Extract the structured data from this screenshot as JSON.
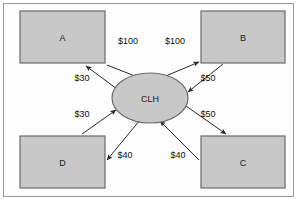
{
  "diagram": {
    "background_color": "#fdfdfd",
    "border_color": "#9a9a9a",
    "node_fill_color": "#c8c8c8",
    "node_stroke_color": "#6b6b6b",
    "edge_color": "#2b2b2b",
    "nodes": [
      {
        "id": "A",
        "label": "A",
        "shape": "rectangle",
        "x": 20,
        "y": 11,
        "w": 85,
        "h": 52
      },
      {
        "id": "B",
        "label": "B",
        "shape": "rectangle",
        "x": 201,
        "y": 11,
        "w": 84,
        "h": 52
      },
      {
        "id": "C",
        "label": "C",
        "shape": "rectangle",
        "x": 201,
        "y": 136,
        "w": 84,
        "h": 52
      },
      {
        "id": "D",
        "label": "D",
        "shape": "rectangle",
        "x": 20,
        "y": 136,
        "w": 85,
        "h": 52
      },
      {
        "id": "CLH",
        "label": "CLH",
        "shape": "ellipse",
        "cx": 150,
        "cy": 98,
        "rx": 38,
        "ry": 25
      }
    ],
    "edges": [
      {
        "from": "A",
        "to": "CLH",
        "label": "$100",
        "label_x": 128,
        "label_y": 44
      },
      {
        "from": "CLH",
        "to": "B",
        "label": "$100",
        "label_x": 175,
        "label_y": 44
      },
      {
        "from": "CLH",
        "to": "A",
        "label": "$30",
        "label_x": 82,
        "label_y": 81
      },
      {
        "from": "D",
        "to": "CLH",
        "label": "$30",
        "label_x": 82,
        "label_y": 117
      },
      {
        "from": "B",
        "to": "CLH",
        "label": "$50",
        "label_x": 208,
        "label_y": 81
      },
      {
        "from": "CLH",
        "to": "C",
        "label": "$50",
        "label_x": 208,
        "label_y": 117
      },
      {
        "from": "CLH",
        "to": "D",
        "label": "$40",
        "label_x": 125,
        "label_y": 158
      },
      {
        "from": "C",
        "to": "CLH",
        "label": "$40",
        "label_x": 178,
        "label_y": 158
      }
    ]
  }
}
